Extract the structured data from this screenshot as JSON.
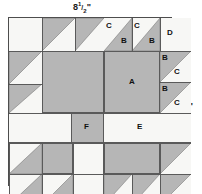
{
  "diagram": {
    "dimensions": {
      "top": {
        "whole": "8",
        "numerator": "1",
        "slash": "/",
        "denominator": "2",
        "unit": "\""
      },
      "right": {
        "whole": "8",
        "numerator": "1",
        "slash": "/",
        "denominator": "2",
        "unit": "\""
      }
    },
    "colors": {
      "fabric_dark": "#b6b6b6",
      "fabric_light": "#f7f7f5",
      "outline": "#4d4d4d",
      "grid": "#5a5a5a",
      "label_text": "#111111",
      "page_background": "#ffffff"
    },
    "labels": {
      "a": "A",
      "b": "B",
      "c": "C",
      "d": "D",
      "e": "E",
      "f": "F"
    },
    "pieces": [
      {
        "id": "A",
        "label": "A",
        "shape": "square",
        "fabric": "dark",
        "count": 4
      },
      {
        "id": "B",
        "label": "B",
        "shape": "half-square-triangle",
        "fabric": "dark",
        "count": 16
      },
      {
        "id": "C",
        "label": "C",
        "shape": "half-square-triangle",
        "fabric": "light",
        "count": 16
      },
      {
        "id": "D",
        "label": "D",
        "shape": "square",
        "fabric": "light",
        "count": 4
      },
      {
        "id": "E",
        "label": "E",
        "shape": "rectangle",
        "fabric": "light",
        "count": 4
      },
      {
        "id": "F",
        "label": "F",
        "shape": "square",
        "fabric": "dark",
        "count": 1
      }
    ],
    "visible_labels": {
      "top_right_quadrant": [
        "C",
        "B",
        "C",
        "B",
        "D",
        "B",
        "C",
        "B",
        "C",
        "A"
      ],
      "center_vertical": "E",
      "center_horizontal": "E",
      "center_square": "F"
    }
  }
}
